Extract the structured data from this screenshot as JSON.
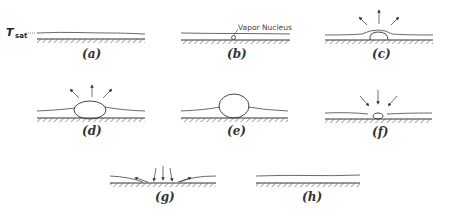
{
  "figure": {
    "temperature_label": "T",
    "temperature_subscript": "sat",
    "annotation": "Vapor Nucleus",
    "panels": [
      {
        "id": "a",
        "label": "(a)"
      },
      {
        "id": "b",
        "label": "(b)"
      },
      {
        "id": "c",
        "label": "(c)"
      },
      {
        "id": "d",
        "label": "(d)"
      },
      {
        "id": "e",
        "label": "(e)"
      },
      {
        "id": "f",
        "label": "(f)"
      },
      {
        "id": "g",
        "label": "(g)"
      },
      {
        "id": "h",
        "label": "(h)"
      }
    ]
  },
  "colors": {
    "ink": "#333333",
    "background": "#ffffff"
  }
}
